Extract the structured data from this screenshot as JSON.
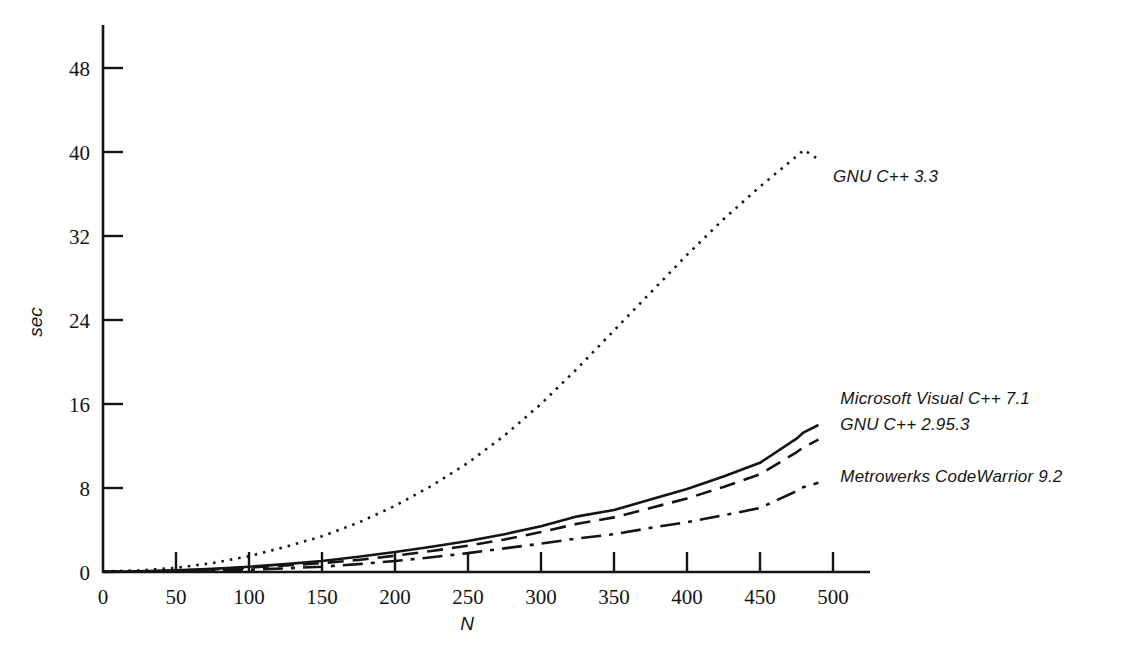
{
  "chart_data": {
    "type": "line",
    "title": "",
    "xlabel": "N",
    "ylabel": "sec",
    "xlim": [
      0,
      515
    ],
    "ylim": [
      0,
      51
    ],
    "grid": false,
    "legend_position": "inline-right-of-curve-ends",
    "xticks": [
      0,
      50,
      100,
      150,
      200,
      250,
      300,
      350,
      400,
      450,
      500
    ],
    "yticks": [
      0,
      8,
      16,
      24,
      32,
      40,
      48
    ],
    "xtick_labels": [
      "0",
      "50",
      "100",
      "150",
      "200",
      "250",
      "300",
      "350",
      "400",
      "450",
      "500"
    ],
    "ytick_labels": [
      "0",
      "8",
      "16",
      "24",
      "32",
      "40",
      "48"
    ],
    "x": [
      0,
      25,
      50,
      75,
      100,
      125,
      150,
      175,
      200,
      225,
      250,
      275,
      300,
      325,
      350,
      375,
      400,
      425,
      450,
      475,
      480,
      490
    ],
    "series": [
      {
        "name": "GNU C++ 3.3",
        "label": "GNU C++ 3.3",
        "style": "dotted",
        "color": "#141414",
        "values": [
          0.05,
          0.15,
          0.4,
          0.85,
          1.5,
          2.4,
          3.4,
          4.7,
          6.3,
          8.2,
          10.4,
          13.0,
          16.0,
          19.4,
          23.0,
          26.6,
          30.2,
          33.6,
          36.7,
          39.6,
          40.2,
          39.3
        ],
        "label_x": 500,
        "label_y": 37.5
      },
      {
        "name": "Microsoft Visual C++ 7.1",
        "label": "Microsoft Visual C++ 7.1",
        "style": "solid",
        "color": "#141414",
        "values": [
          0.02,
          0.06,
          0.15,
          0.3,
          0.5,
          0.75,
          1.05,
          1.45,
          1.9,
          2.4,
          2.95,
          3.6,
          4.35,
          5.3,
          5.9,
          6.9,
          7.9,
          9.1,
          10.4,
          12.7,
          13.3,
          14.0
        ],
        "label_x": 505,
        "label_y": 16.4
      },
      {
        "name": "GNU C++ 2.95.3",
        "label": "GNU C++ 2.95.3",
        "style": "dashed",
        "color": "#141414",
        "values": [
          0.02,
          0.05,
          0.12,
          0.25,
          0.42,
          0.62,
          0.85,
          1.15,
          1.55,
          2.0,
          2.5,
          3.1,
          3.8,
          4.6,
          5.2,
          6.1,
          7.0,
          8.1,
          9.3,
          11.4,
          11.9,
          12.6
        ],
        "label_x": 505,
        "label_y": 13.9
      },
      {
        "name": "Metrowerks CodeWarrior 9.2",
        "label": "Metrowerks CodeWarrior 9.2",
        "style": "dashdot",
        "color": "#141414",
        "values": [
          0.01,
          0.03,
          0.07,
          0.13,
          0.22,
          0.35,
          0.5,
          0.75,
          1.05,
          1.4,
          1.8,
          2.25,
          2.7,
          3.2,
          3.6,
          4.2,
          4.75,
          5.4,
          6.1,
          7.7,
          8.1,
          8.5
        ],
        "label_x": 505,
        "label_y": 9.0
      }
    ]
  },
  "axes": {
    "y_axis_label": "sec",
    "x_axis_label": "N"
  },
  "colors": {
    "ink": "#141414",
    "background": "#ffffff"
  }
}
